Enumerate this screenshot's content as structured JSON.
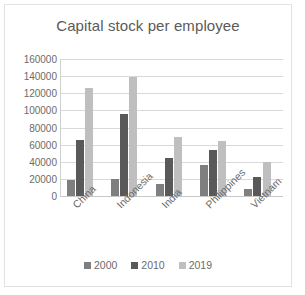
{
  "chart_data": {
    "type": "bar",
    "title": "Capital stock per employee",
    "xlabel": "",
    "ylabel": "",
    "ylim": [
      0,
      160000
    ],
    "ytick_step": 20000,
    "yticks": [
      "160000",
      "140000",
      "120000",
      "100000",
      "80000",
      "60000",
      "40000",
      "20000",
      "0"
    ],
    "ytick_values": [
      160000,
      140000,
      120000,
      100000,
      80000,
      60000,
      40000,
      20000,
      0
    ],
    "grid": true,
    "grid_axis": "y",
    "legend_position": "bottom",
    "categories": [
      "China",
      "Indonesia",
      "India",
      "Philippines",
      "Vietnam"
    ],
    "series": [
      {
        "name": "2000",
        "color": "#7f7f7f",
        "values": [
          18500,
          19500,
          14000,
          36000,
          8500
        ]
      },
      {
        "name": "2010",
        "color": "#595959",
        "values": [
          66000,
          96000,
          44500,
          53500,
          22500
        ]
      },
      {
        "name": "2019",
        "color": "#bfbfbf",
        "values": [
          126500,
          139000,
          69500,
          64500,
          39500
        ]
      }
    ]
  },
  "chart": {
    "title": "Capital stock per employee",
    "plot_background": "#ffffff",
    "gridline_color": "#d9d9d9",
    "axis_text_color": "#6b6b6b",
    "title_color": "#5a5a5a",
    "border_color": "#e2e2e2"
  },
  "legend": {
    "items": [
      {
        "label": "2000",
        "color": "#7f7f7f"
      },
      {
        "label": "2010",
        "color": "#595959"
      },
      {
        "label": "2019",
        "color": "#bfbfbf"
      }
    ]
  }
}
